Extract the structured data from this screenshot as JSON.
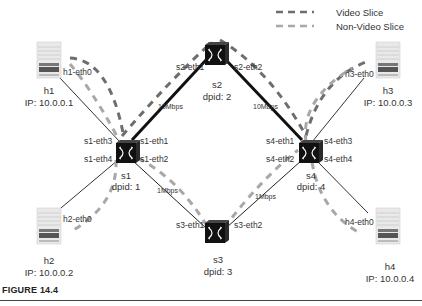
{
  "figure": {
    "caption": "FIGURE 14.4"
  },
  "legend": [
    {
      "label": "Video Slice",
      "color": "#6e6e6e",
      "style": "dashed"
    },
    {
      "label": "Non-Video Slice",
      "color": "#a8a8a8",
      "style": "dashed"
    }
  ],
  "hosts": [
    {
      "name": "h1",
      "ip": "IP: 10.0.0.1",
      "iface": "h1-eth0"
    },
    {
      "name": "h2",
      "ip": "IP: 10.0.0.2",
      "iface": "h2-eth0"
    },
    {
      "name": "h3",
      "ip": "IP: 10.0.0.3",
      "iface": "h3-eth0"
    },
    {
      "name": "h4",
      "ip": "IP: 10.0.0.4",
      "iface": "h4-eth0"
    }
  ],
  "switches": [
    {
      "name": "s1",
      "dpid": "dpid: 1",
      "ports": [
        "s1-eth1",
        "s1-eth2",
        "s1-eth3",
        "s1-eth4"
      ]
    },
    {
      "name": "s2",
      "dpid": "dpid: 2",
      "ports": [
        "s2-eth1",
        "s2-eth2"
      ]
    },
    {
      "name": "s3",
      "dpid": "dpid: 3",
      "ports": [
        "s3-eth1",
        "s3-eth2"
      ]
    },
    {
      "name": "s4",
      "dpid": "dpid: 4",
      "ports": [
        "s4-eth1",
        "s4-eth2",
        "s4-eth3",
        "s4-eth4"
      ]
    }
  ],
  "links": [
    {
      "from": "s1",
      "to": "s2",
      "bandwidth": "10Mbps"
    },
    {
      "from": "s2",
      "to": "s4",
      "bandwidth": "10Mbps"
    },
    {
      "from": "s1",
      "to": "s3",
      "bandwidth": "1Mbps"
    },
    {
      "from": "s3",
      "to": "s4",
      "bandwidth": "1Mbps"
    }
  ],
  "colors": {
    "video_slice": "#6e6e6e",
    "non_video_slice": "#a8a8a8",
    "link": "#222222",
    "switch": "#111111"
  }
}
